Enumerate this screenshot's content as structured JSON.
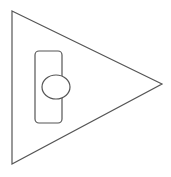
{
  "diagram": {
    "background": "#ffffff",
    "stroke_color": "#555555",
    "stroke_width": 1.2,
    "shapes": {
      "triangle": {
        "points": "12,11 162,84 12,164",
        "fill": "#ffffff"
      },
      "rounded_rect": {
        "x": 35,
        "y": 51,
        "width": 27,
        "height": 72,
        "rx": 4,
        "fill": "#ffffff"
      },
      "ellipse": {
        "cx": 56,
        "cy": 87,
        "rx": 14,
        "ry": 12,
        "fill": "#ffffff"
      }
    }
  }
}
